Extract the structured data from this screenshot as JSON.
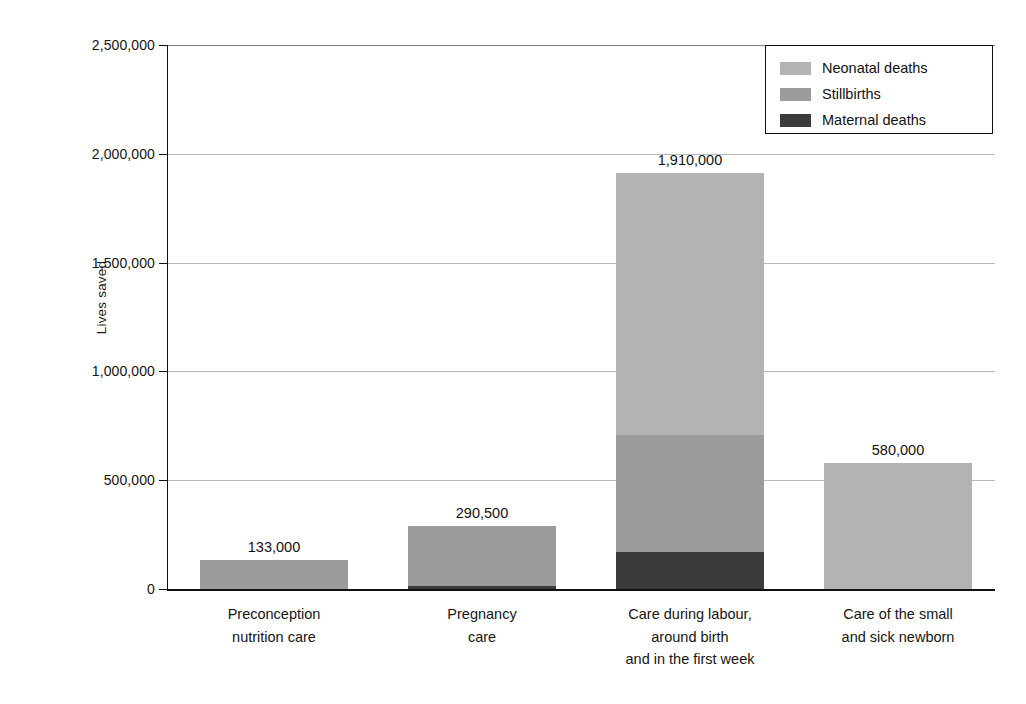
{
  "chart_data": {
    "type": "bar",
    "subtype": "stacked-vertical",
    "title": "",
    "xlabel": "",
    "ylabel": "Lives saved",
    "ylim": [
      0,
      2500000
    ],
    "ytick_values": [
      0,
      500000,
      1000000,
      1500000,
      2000000,
      2500000
    ],
    "ytick_labels": [
      "0",
      "500,000",
      "1,000,000",
      "1,500,000",
      "2,000,000",
      "2,500,000"
    ],
    "grid": true,
    "grid_axis": "y",
    "legend_position": "top-right",
    "categories": [
      "Preconception nutrition care",
      "Pregnancy care",
      "Care during labour, around birth and in the first week",
      "Care of the small and sick newborn"
    ],
    "category_label_lines": [
      [
        "Preconception",
        "nutrition care"
      ],
      [
        "Pregnancy",
        "care"
      ],
      [
        "Care during labour,",
        "around birth",
        "and in the first week"
      ],
      [
        "Care of the small",
        "and sick newborn"
      ]
    ],
    "series": [
      {
        "name": "Neonatal deaths",
        "color": "#b3b3b3",
        "values": [
          0,
          0,
          1200000,
          580000
        ]
      },
      {
        "name": "Stillbirths",
        "color": "#9c9c9c",
        "values": [
          133000,
          276500,
          540000,
          0
        ]
      },
      {
        "name": "Maternal deaths",
        "color": "#3b3b3b",
        "values": [
          0,
          14000,
          170000,
          0
        ]
      }
    ],
    "totals": [
      133000,
      290500,
      1910000,
      580000
    ],
    "total_labels": [
      "133,000",
      "290,500",
      "1,910,000",
      "580,000"
    ]
  },
  "legend": {
    "items": [
      {
        "label": "Neonatal deaths",
        "color": "#b3b3b3"
      },
      {
        "label": "Stillbirths",
        "color": "#9c9c9c"
      },
      {
        "label": "Maternal deaths",
        "color": "#3b3b3b"
      }
    ]
  },
  "axis": {
    "y_title": "Lives saved"
  }
}
